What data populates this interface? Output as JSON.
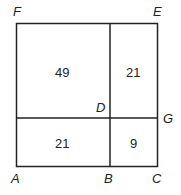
{
  "diagram": {
    "points": {
      "A": "A",
      "B": "B",
      "C": "C",
      "D": "D",
      "E": "E",
      "F": "F",
      "G": "G"
    },
    "regions": {
      "top_left": "49",
      "top_right": "21",
      "bottom_left": "21",
      "bottom_right": "9"
    },
    "line_color": "#222222"
  }
}
